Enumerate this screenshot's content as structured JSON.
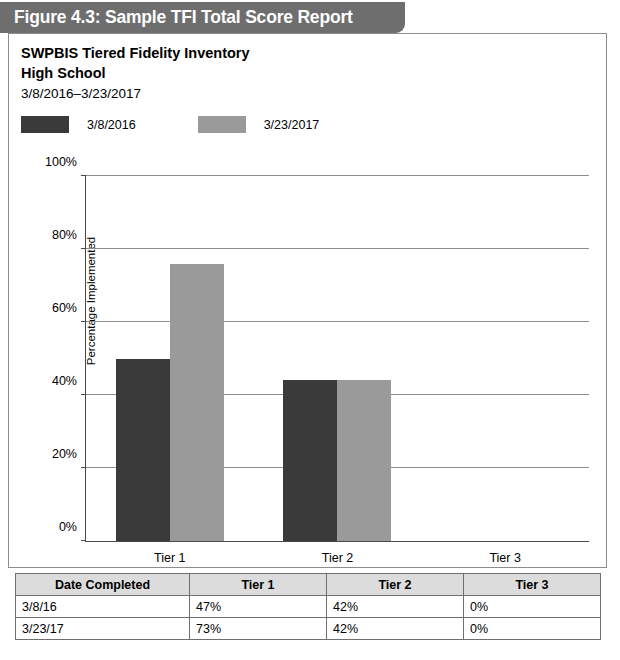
{
  "figure": {
    "banner_title": "Figure 4.3: Sample TFI Total Score Report",
    "banner_color": "#6e6e6e"
  },
  "report": {
    "title": "SWPBIS Tiered Fidelity Inventory",
    "subtitle": "High School",
    "date_range": "3/8/2016–3/23/2017"
  },
  "colors": {
    "series_1": "#3a3a3a",
    "series_2": "#9a9a9a",
    "gridline": "#8d8d8d",
    "axis": "#4a4a4a",
    "table_header_bg": "#dcdcdc",
    "table_border": "#6f6f6f"
  },
  "chart_data": {
    "type": "bar",
    "title": "SWPBIS Tiered Fidelity Inventory",
    "subtitle": "High School",
    "xlabel": "",
    "ylabel": "Percentage Implemented",
    "ylim": [
      0,
      100
    ],
    "ytick_labels": [
      "0%",
      "20%",
      "40%",
      "60%",
      "80%",
      "100%"
    ],
    "ytick_values": [
      0,
      20,
      40,
      60,
      80,
      100
    ],
    "grid": true,
    "legend_position": "top-left",
    "categories": [
      "Tier 1",
      "Tier 2",
      "Tier 3"
    ],
    "series": [
      {
        "name": "3/8/2016",
        "color": "#3a3a3a",
        "values": [
          47,
          42,
          0
        ],
        "plotted_heights_pct": [
          50,
          44,
          0
        ]
      },
      {
        "name": "3/23/2017",
        "color": "#9a9a9a",
        "values": [
          73,
          42,
          0
        ],
        "plotted_heights_pct": [
          76,
          44,
          0
        ]
      }
    ]
  },
  "legend": {
    "entries": [
      {
        "label": "3/8/2016",
        "color": "#3a3a3a"
      },
      {
        "label": "3/23/2017",
        "color": "#9a9a9a"
      }
    ]
  },
  "table": {
    "headers": [
      "Date Completed",
      "Tier 1",
      "Tier 2",
      "Tier 3"
    ],
    "rows": [
      {
        "date": "3/8/16",
        "tier1": "47%",
        "tier2": "42%",
        "tier3": "0%"
      },
      {
        "date": "3/23/17",
        "tier1": "73%",
        "tier2": "42%",
        "tier3": "0%"
      }
    ]
  }
}
